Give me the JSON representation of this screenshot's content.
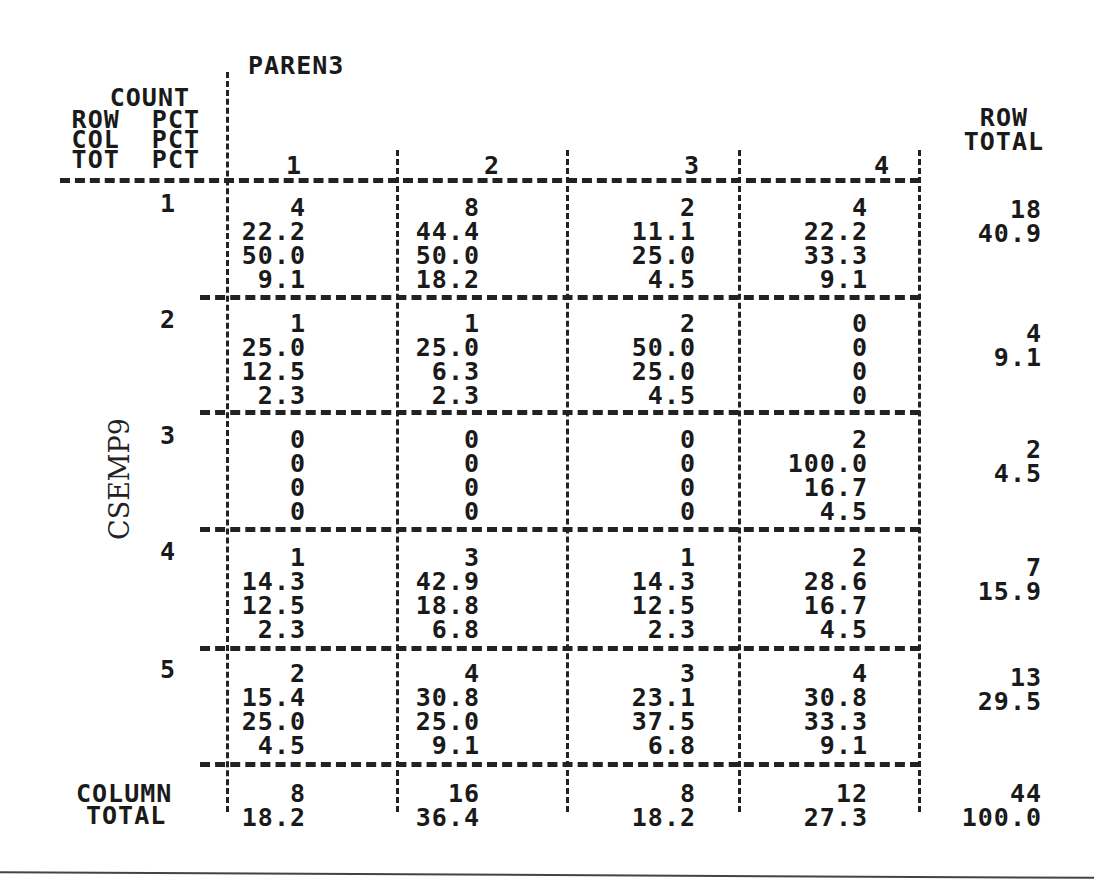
{
  "table": {
    "column_variable": "PAREN3",
    "row_variable": "CSEMP9",
    "legend": [
      "COUNT",
      "ROW  PCT",
      "COL  PCT",
      "TOT  PCT"
    ],
    "column_categories": [
      "1",
      "2",
      "3",
      "4"
    ],
    "row_total_header": [
      "ROW",
      "TOTAL"
    ],
    "column_total_header": [
      "COLUMN",
      "TOTAL"
    ],
    "rows": [
      {
        "label": "1",
        "cells": [
          {
            "count": "4",
            "row_pct": "22.2",
            "col_pct": "50.0",
            "tot_pct": "9.1"
          },
          {
            "count": "8",
            "row_pct": "44.4",
            "col_pct": "50.0",
            "tot_pct": "18.2"
          },
          {
            "count": "2",
            "row_pct": "11.1",
            "col_pct": "25.0",
            "tot_pct": "4.5"
          },
          {
            "count": "4",
            "row_pct": "22.2",
            "col_pct": "33.3",
            "tot_pct": "9.1"
          }
        ],
        "row_total": {
          "count": "18",
          "pct": "40.9"
        }
      },
      {
        "label": "2",
        "cells": [
          {
            "count": "1",
            "row_pct": "25.0",
            "col_pct": "12.5",
            "tot_pct": "2.3"
          },
          {
            "count": "1",
            "row_pct": "25.0",
            "col_pct": "6.3",
            "tot_pct": "2.3"
          },
          {
            "count": "2",
            "row_pct": "50.0",
            "col_pct": "25.0",
            "tot_pct": "4.5"
          },
          {
            "count": "0",
            "row_pct": "0",
            "col_pct": "0",
            "tot_pct": "0"
          }
        ],
        "row_total": {
          "count": "4",
          "pct": "9.1"
        }
      },
      {
        "label": "3",
        "cells": [
          {
            "count": "0",
            "row_pct": "0",
            "col_pct": "0",
            "tot_pct": "0"
          },
          {
            "count": "0",
            "row_pct": "0",
            "col_pct": "0",
            "tot_pct": "0"
          },
          {
            "count": "0",
            "row_pct": "0",
            "col_pct": "0",
            "tot_pct": "0"
          },
          {
            "count": "2",
            "row_pct": "100.0",
            "col_pct": "16.7",
            "tot_pct": "4.5"
          }
        ],
        "row_total": {
          "count": "2",
          "pct": "4.5"
        }
      },
      {
        "label": "4",
        "cells": [
          {
            "count": "1",
            "row_pct": "14.3",
            "col_pct": "12.5",
            "tot_pct": "2.3"
          },
          {
            "count": "3",
            "row_pct": "42.9",
            "col_pct": "18.8",
            "tot_pct": "6.8"
          },
          {
            "count": "1",
            "row_pct": "14.3",
            "col_pct": "12.5",
            "tot_pct": "2.3"
          },
          {
            "count": "2",
            "row_pct": "28.6",
            "col_pct": "16.7",
            "tot_pct": "4.5"
          }
        ],
        "row_total": {
          "count": "7",
          "pct": "15.9"
        }
      },
      {
        "label": "5",
        "cells": [
          {
            "count": "2",
            "row_pct": "15.4",
            "col_pct": "25.0",
            "tot_pct": "4.5"
          },
          {
            "count": "4",
            "row_pct": "30.8",
            "col_pct": "25.0",
            "tot_pct": "9.1"
          },
          {
            "count": "3",
            "row_pct": "23.1",
            "col_pct": "37.5",
            "tot_pct": "6.8"
          },
          {
            "count": "4",
            "row_pct": "30.8",
            "col_pct": "33.3",
            "tot_pct": "9.1"
          }
        ],
        "row_total": {
          "count": "13",
          "pct": "29.5"
        }
      }
    ],
    "column_totals": [
      {
        "count": "8",
        "pct": "18.2"
      },
      {
        "count": "16",
        "pct": "36.4"
      },
      {
        "count": "8",
        "pct": "18.2"
      },
      {
        "count": "12",
        "pct": "27.3"
      }
    ],
    "grand_total": {
      "count": "44",
      "pct": "100.0"
    }
  }
}
